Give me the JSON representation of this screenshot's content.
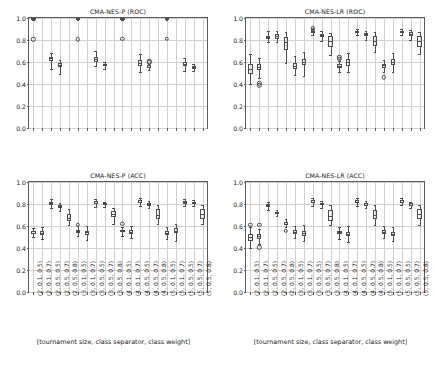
{
  "figure": {
    "xaxis_title": "[tournament size, class separator, class weight]",
    "categories": [
      "(2, 0.1, 0.5)",
      "(2, 0.1, 0.7)",
      "(2, 0.5, 0.5)",
      "(2, 0.5, 0.7)",
      "(2, 0.5, 0.8)",
      "(3, 0.1, 0.5)",
      "(3, 0.1, 0.7)",
      "(3, 0.5, 0.5)",
      "(3, 0.5, 0.7)",
      "(3, 0.5, 0.8)",
      "(4, 0.1, 0.5)",
      "(4, 0.1, 0.7)",
      "(4, 0.5, 0.5)",
      "(4, 0.5, 0.7)",
      "(4, 0.5, 0.8)",
      "(5, 0.1, 0.5)",
      "(5, 0.1, 0.7)",
      "(5, 0.5, 0.5)",
      "(5, 0.5, 0.7)",
      "(5, 0.5, 0.8)"
    ],
    "yticks": [
      "0.0",
      "0.2",
      "0.4",
      "0.6",
      "0.8",
      "1.0"
    ],
    "ylim": [
      0.0,
      1.0
    ],
    "grid": true,
    "box_edge_color": "#4d4d4d",
    "grid_color": "#cfcfcf",
    "axis_color": "#5a5a5a"
  },
  "chart_data": [
    {
      "type": "box",
      "panel": "top-left",
      "title": "CMA-NES-P (ROC)",
      "xlabel": "",
      "ylabel": "",
      "ylim": [
        0.0,
        1.0
      ],
      "grid": true,
      "categories": [
        "(2, 0.1, 0.5)",
        "(2, 0.1, 0.7)",
        "(2, 0.5, 0.5)",
        "(2, 0.5, 0.7)",
        "(2, 0.5, 0.8)",
        "(3, 0.1, 0.5)",
        "(3, 0.1, 0.7)",
        "(3, 0.5, 0.5)",
        "(3, 0.5, 0.7)",
        "(3, 0.5, 0.8)",
        "(4, 0.1, 0.5)",
        "(4, 0.1, 0.7)",
        "(4, 0.5, 0.5)",
        "(4, 0.5, 0.7)",
        "(4, 0.5, 0.8)",
        "(5, 0.1, 0.5)",
        "(5, 0.1, 0.7)",
        "(5, 0.5, 0.5)",
        "(5, 0.5, 0.7)",
        "(5, 0.5, 0.8)"
      ],
      "boxes": [
        {
          "i": 0,
          "whislo": 0.985,
          "q1": 0.992,
          "med": 0.996,
          "q3": 0.999,
          "whishi": 1.0,
          "fliers": [
            0.805
          ]
        },
        {
          "i": 2,
          "whislo": 0.535,
          "q1": 0.608,
          "med": 0.632,
          "q3": 0.648,
          "whishi": 0.685,
          "fliers": []
        },
        {
          "i": 3,
          "whislo": 0.49,
          "q1": 0.552,
          "med": 0.572,
          "q3": 0.59,
          "whishi": 0.622,
          "fliers": []
        },
        {
          "i": 5,
          "whislo": 0.986,
          "q1": 0.993,
          "med": 0.997,
          "q3": 0.999,
          "whishi": 1.0,
          "fliers": [
            0.808
          ]
        },
        {
          "i": 7,
          "whislo": 0.565,
          "q1": 0.6,
          "med": 0.625,
          "q3": 0.648,
          "whishi": 0.7,
          "fliers": []
        },
        {
          "i": 8,
          "whislo": 0.54,
          "q1": 0.562,
          "med": 0.575,
          "q3": 0.585,
          "whishi": 0.6,
          "fliers": []
        },
        {
          "i": 10,
          "whislo": 0.986,
          "q1": 0.993,
          "med": 0.997,
          "q3": 0.999,
          "whishi": 1.0,
          "fliers": [
            0.81
          ]
        },
        {
          "i": 12,
          "whislo": 0.512,
          "q1": 0.565,
          "med": 0.588,
          "q3": 0.618,
          "whishi": 0.67,
          "fliers": []
        },
        {
          "i": 13,
          "whislo": 0.528,
          "q1": 0.548,
          "med": 0.558,
          "q3": 0.57,
          "whishi": 0.585,
          "fliers": [
            0.598,
            0.608
          ]
        },
        {
          "i": 15,
          "whislo": 0.986,
          "q1": 0.994,
          "med": 0.998,
          "q3": 1.0,
          "whishi": 1.0,
          "fliers": [
            0.812
          ]
        },
        {
          "i": 17,
          "whislo": 0.515,
          "q1": 0.568,
          "med": 0.583,
          "q3": 0.598,
          "whishi": 0.64,
          "fliers": []
        },
        {
          "i": 18,
          "whislo": 0.52,
          "q1": 0.54,
          "med": 0.552,
          "q3": 0.565,
          "whishi": 0.585,
          "fliers": []
        }
      ]
    },
    {
      "type": "box",
      "panel": "top-right",
      "title": "CMA-NES-LR (ROC)",
      "xlabel": "",
      "ylabel": "",
      "ylim": [
        0.0,
        1.0
      ],
      "grid": true,
      "categories": [
        "(2, 0.1, 0.5)",
        "(2, 0.1, 0.7)",
        "(2, 0.5, 0.5)",
        "(2, 0.5, 0.7)",
        "(2, 0.5, 0.8)",
        "(3, 0.1, 0.5)",
        "(3, 0.1, 0.7)",
        "(3, 0.5, 0.5)",
        "(3, 0.5, 0.7)",
        "(3, 0.5, 0.8)",
        "(4, 0.1, 0.5)",
        "(4, 0.1, 0.7)",
        "(4, 0.5, 0.5)",
        "(4, 0.5, 0.7)",
        "(4, 0.5, 0.8)",
        "(5, 0.1, 0.5)",
        "(5, 0.1, 0.7)",
        "(5, 0.5, 0.5)",
        "(5, 0.5, 0.7)",
        "(5, 0.5, 0.8)"
      ],
      "boxes": [
        {
          "i": 0,
          "whislo": 0.4,
          "q1": 0.495,
          "med": 0.54,
          "q3": 0.58,
          "whishi": 0.675,
          "fliers": []
        },
        {
          "i": 1,
          "whislo": 0.455,
          "q1": 0.525,
          "med": 0.558,
          "q3": 0.58,
          "whishi": 0.64,
          "fliers": [
            0.388,
            0.408
          ]
        },
        {
          "i": 2,
          "whislo": 0.785,
          "q1": 0.81,
          "med": 0.825,
          "q3": 0.84,
          "whishi": 0.88,
          "fliers": []
        },
        {
          "i": 3,
          "whislo": 0.78,
          "q1": 0.808,
          "med": 0.832,
          "q3": 0.852,
          "whishi": 0.885,
          "fliers": []
        },
        {
          "i": 4,
          "whislo": 0.59,
          "q1": 0.712,
          "med": 0.785,
          "q3": 0.828,
          "whishi": 0.875,
          "fliers": []
        },
        {
          "i": 5,
          "whislo": 0.48,
          "q1": 0.54,
          "med": 0.565,
          "q3": 0.588,
          "whishi": 0.655,
          "fliers": []
        },
        {
          "i": 6,
          "whislo": 0.475,
          "q1": 0.57,
          "med": 0.602,
          "q3": 0.63,
          "whishi": 0.69,
          "fliers": []
        },
        {
          "i": 7,
          "whislo": 0.848,
          "q1": 0.862,
          "med": 0.872,
          "q3": 0.885,
          "whishi": 0.9,
          "fliers": [
            0.895,
            0.905
          ]
        },
        {
          "i": 8,
          "whislo": 0.79,
          "q1": 0.825,
          "med": 0.842,
          "q3": 0.858,
          "whishi": 0.878,
          "fliers": []
        },
        {
          "i": 9,
          "whislo": 0.668,
          "q1": 0.735,
          "med": 0.79,
          "q3": 0.832,
          "whishi": 0.862,
          "fliers": []
        },
        {
          "i": 10,
          "whislo": 0.51,
          "q1": 0.548,
          "med": 0.565,
          "q3": 0.58,
          "whishi": 0.605,
          "fliers": [
            0.628,
            0.642
          ]
        },
        {
          "i": 11,
          "whislo": 0.51,
          "q1": 0.565,
          "med": 0.598,
          "q3": 0.625,
          "whishi": 0.682,
          "fliers": []
        },
        {
          "i": 12,
          "whislo": 0.845,
          "q1": 0.86,
          "med": 0.872,
          "q3": 0.885,
          "whishi": 0.9,
          "fliers": []
        },
        {
          "i": 13,
          "whislo": 0.8,
          "q1": 0.838,
          "med": 0.855,
          "q3": 0.868,
          "whishi": 0.885,
          "fliers": []
        },
        {
          "i": 14,
          "whislo": 0.69,
          "q1": 0.745,
          "med": 0.795,
          "q3": 0.838,
          "whishi": 0.872,
          "fliers": []
        },
        {
          "i": 15,
          "whislo": 0.505,
          "q1": 0.548,
          "med": 0.57,
          "q3": 0.585,
          "whishi": 0.615,
          "fliers": [
            0.462
          ]
        },
        {
          "i": 16,
          "whislo": 0.512,
          "q1": 0.572,
          "med": 0.598,
          "q3": 0.625,
          "whishi": 0.68,
          "fliers": []
        },
        {
          "i": 17,
          "whislo": 0.845,
          "q1": 0.86,
          "med": 0.872,
          "q3": 0.885,
          "whishi": 0.9,
          "fliers": []
        },
        {
          "i": 18,
          "whislo": 0.802,
          "q1": 0.838,
          "med": 0.855,
          "q3": 0.87,
          "whishi": 0.888,
          "fliers": []
        },
        {
          "i": 19,
          "whislo": 0.672,
          "q1": 0.738,
          "med": 0.792,
          "q3": 0.838,
          "whishi": 0.87,
          "fliers": []
        }
      ]
    },
    {
      "type": "box",
      "panel": "bottom-left",
      "title": "CMA-NES-P (ACC)",
      "xlabel": "[tournament size, class separator, class weight]",
      "ylabel": "",
      "ylim": [
        0.0,
        1.0
      ],
      "grid": true,
      "categories": [
        "(2, 0.1, 0.5)",
        "(2, 0.1, 0.7)",
        "(2, 0.5, 0.5)",
        "(2, 0.5, 0.7)",
        "(2, 0.5, 0.8)",
        "(3, 0.1, 0.5)",
        "(3, 0.1, 0.7)",
        "(3, 0.5, 0.5)",
        "(3, 0.5, 0.7)",
        "(3, 0.5, 0.8)",
        "(4, 0.1, 0.5)",
        "(4, 0.1, 0.7)",
        "(4, 0.5, 0.5)",
        "(4, 0.5, 0.7)",
        "(4, 0.5, 0.8)",
        "(5, 0.1, 0.5)",
        "(5, 0.1, 0.7)",
        "(5, 0.5, 0.5)",
        "(5, 0.5, 0.7)",
        "(5, 0.5, 0.8)"
      ],
      "boxes": [
        {
          "i": 0,
          "whislo": 0.498,
          "q1": 0.528,
          "med": 0.54,
          "q3": 0.552,
          "whishi": 0.58,
          "fliers": []
        },
        {
          "i": 1,
          "whislo": 0.482,
          "q1": 0.522,
          "med": 0.538,
          "q3": 0.552,
          "whishi": 0.59,
          "fliers": []
        },
        {
          "i": 2,
          "whislo": 0.765,
          "q1": 0.795,
          "med": 0.808,
          "q3": 0.822,
          "whishi": 0.848,
          "fliers": []
        },
        {
          "i": 3,
          "whislo": 0.735,
          "q1": 0.768,
          "med": 0.782,
          "q3": 0.795,
          "whishi": 0.812,
          "fliers": []
        },
        {
          "i": 4,
          "whislo": 0.608,
          "q1": 0.648,
          "med": 0.672,
          "q3": 0.71,
          "whishi": 0.758,
          "fliers": []
        },
        {
          "i": 5,
          "whislo": 0.512,
          "q1": 0.54,
          "med": 0.552,
          "q3": 0.565,
          "whishi": 0.598,
          "fliers": [
            0.612
          ]
        },
        {
          "i": 6,
          "whislo": 0.472,
          "q1": 0.522,
          "med": 0.542,
          "q3": 0.558,
          "whishi": 0.598,
          "fliers": []
        },
        {
          "i": 7,
          "whislo": 0.775,
          "q1": 0.8,
          "med": 0.812,
          "q3": 0.825,
          "whishi": 0.848,
          "fliers": []
        },
        {
          "i": 8,
          "whislo": 0.77,
          "q1": 0.788,
          "med": 0.798,
          "q3": 0.808,
          "whishi": 0.822,
          "fliers": []
        },
        {
          "i": 9,
          "whislo": 0.622,
          "q1": 0.682,
          "med": 0.705,
          "q3": 0.735,
          "whishi": 0.765,
          "fliers": []
        },
        {
          "i": 10,
          "whislo": 0.512,
          "q1": 0.542,
          "med": 0.555,
          "q3": 0.568,
          "whishi": 0.592,
          "fliers": [
            0.62
          ]
        },
        {
          "i": 11,
          "whislo": 0.488,
          "q1": 0.528,
          "med": 0.545,
          "q3": 0.562,
          "whishi": 0.6,
          "fliers": []
        },
        {
          "i": 12,
          "whislo": 0.778,
          "q1": 0.808,
          "med": 0.82,
          "q3": 0.832,
          "whishi": 0.855,
          "fliers": []
        },
        {
          "i": 13,
          "whislo": 0.765,
          "q1": 0.785,
          "med": 0.798,
          "q3": 0.808,
          "whishi": 0.825,
          "fliers": []
        },
        {
          "i": 14,
          "whislo": 0.618,
          "q1": 0.668,
          "med": 0.702,
          "q3": 0.752,
          "whishi": 0.788,
          "fliers": []
        },
        {
          "i": 15,
          "whislo": 0.478,
          "q1": 0.522,
          "med": 0.54,
          "q3": 0.558,
          "whishi": 0.592,
          "fliers": []
        },
        {
          "i": 16,
          "whislo": 0.468,
          "q1": 0.532,
          "med": 0.558,
          "q3": 0.578,
          "whishi": 0.622,
          "fliers": []
        },
        {
          "i": 17,
          "whislo": 0.78,
          "q1": 0.802,
          "med": 0.815,
          "q3": 0.828,
          "whishi": 0.848,
          "fliers": []
        },
        {
          "i": 18,
          "whislo": 0.782,
          "q1": 0.798,
          "med": 0.808,
          "q3": 0.818,
          "whishi": 0.832,
          "fliers": []
        },
        {
          "i": 19,
          "whislo": 0.618,
          "q1": 0.668,
          "med": 0.712,
          "q3": 0.755,
          "whishi": 0.792,
          "fliers": []
        }
      ]
    },
    {
      "type": "box",
      "panel": "bottom-right",
      "title": "CMA-NES-LR (ACC)",
      "xlabel": "[tournament size, class separator, class weight]",
      "ylabel": "",
      "ylim": [
        0.0,
        1.0
      ],
      "grid": true,
      "categories": [
        "(2, 0.1, 0.5)",
        "(2, 0.1, 0.7)",
        "(2, 0.5, 0.5)",
        "(2, 0.5, 0.7)",
        "(2, 0.5, 0.8)",
        "(3, 0.1, 0.5)",
        "(3, 0.1, 0.7)",
        "(3, 0.5, 0.5)",
        "(3, 0.5, 0.7)",
        "(3, 0.5, 0.8)",
        "(4, 0.1, 0.5)",
        "(4, 0.1, 0.7)",
        "(4, 0.5, 0.5)",
        "(4, 0.5, 0.7)",
        "(4, 0.5, 0.8)",
        "(5, 0.1, 0.5)",
        "(5, 0.1, 0.7)",
        "(5, 0.5, 0.5)",
        "(5, 0.5, 0.7)",
        "(5, 0.5, 0.8)"
      ],
      "boxes": [
        {
          "i": 0,
          "whislo": 0.398,
          "q1": 0.468,
          "med": 0.498,
          "q3": 0.528,
          "whishi": 0.59,
          "fliers": [
            0.612
          ]
        },
        {
          "i": 1,
          "whislo": 0.432,
          "q1": 0.485,
          "med": 0.508,
          "q3": 0.528,
          "whishi": 0.572,
          "fliers": [
            0.408,
            0.612
          ]
        },
        {
          "i": 2,
          "whislo": 0.748,
          "q1": 0.775,
          "med": 0.788,
          "q3": 0.8,
          "whishi": 0.822,
          "fliers": []
        },
        {
          "i": 3,
          "whislo": 0.688,
          "q1": 0.705,
          "med": 0.715,
          "q3": 0.728,
          "whishi": 0.748,
          "fliers": []
        },
        {
          "i": 4,
          "whislo": 0.588,
          "q1": 0.608,
          "med": 0.62,
          "q3": 0.632,
          "whishi": 0.668,
          "fliers": [
            0.558
          ]
        },
        {
          "i": 5,
          "whislo": 0.488,
          "q1": 0.528,
          "med": 0.545,
          "q3": 0.562,
          "whishi": 0.598,
          "fliers": []
        },
        {
          "i": 6,
          "whislo": 0.462,
          "q1": 0.512,
          "med": 0.535,
          "q3": 0.558,
          "whishi": 0.608,
          "fliers": []
        },
        {
          "i": 7,
          "whislo": 0.778,
          "q1": 0.805,
          "med": 0.818,
          "q3": 0.832,
          "whishi": 0.855,
          "fliers": []
        },
        {
          "i": 8,
          "whislo": 0.768,
          "q1": 0.788,
          "med": 0.798,
          "q3": 0.81,
          "whishi": 0.828,
          "fliers": []
        },
        {
          "i": 9,
          "whislo": 0.612,
          "q1": 0.648,
          "med": 0.688,
          "q3": 0.742,
          "whishi": 0.79,
          "fliers": []
        },
        {
          "i": 10,
          "whislo": 0.478,
          "q1": 0.525,
          "med": 0.542,
          "q3": 0.558,
          "whishi": 0.592,
          "fliers": []
        },
        {
          "i": 11,
          "whislo": 0.455,
          "q1": 0.508,
          "med": 0.528,
          "q3": 0.548,
          "whishi": 0.598,
          "fliers": []
        },
        {
          "i": 12,
          "whislo": 0.782,
          "q1": 0.805,
          "med": 0.82,
          "q3": 0.835,
          "whishi": 0.855,
          "fliers": []
        },
        {
          "i": 13,
          "whislo": 0.762,
          "q1": 0.785,
          "med": 0.795,
          "q3": 0.808,
          "whishi": 0.83,
          "fliers": []
        },
        {
          "i": 14,
          "whislo": 0.612,
          "q1": 0.662,
          "med": 0.702,
          "q3": 0.748,
          "whishi": 0.788,
          "fliers": []
        },
        {
          "i": 15,
          "whislo": 0.488,
          "q1": 0.528,
          "med": 0.545,
          "q3": 0.562,
          "whishi": 0.598,
          "fliers": []
        },
        {
          "i": 16,
          "whislo": 0.462,
          "q1": 0.508,
          "med": 0.528,
          "q3": 0.548,
          "whishi": 0.595,
          "fliers": []
        },
        {
          "i": 17,
          "whislo": 0.788,
          "q1": 0.808,
          "med": 0.822,
          "q3": 0.835,
          "whishi": 0.855,
          "fliers": []
        },
        {
          "i": 18,
          "whislo": 0.765,
          "q1": 0.785,
          "med": 0.795,
          "q3": 0.805,
          "whishi": 0.822,
          "fliers": []
        },
        {
          "i": 19,
          "whislo": 0.612,
          "q1": 0.665,
          "med": 0.708,
          "q3": 0.752,
          "whishi": 0.79,
          "fliers": []
        }
      ]
    }
  ]
}
